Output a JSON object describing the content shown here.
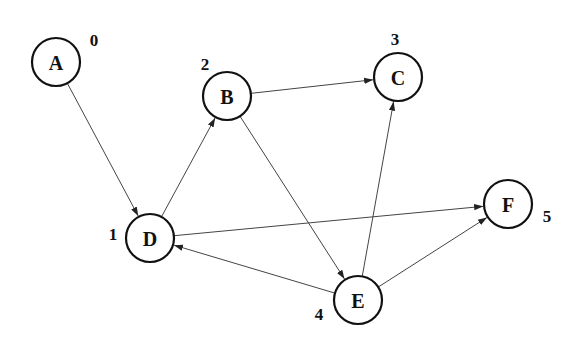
{
  "diagram": {
    "type": "directed-graph",
    "node_radius": 24,
    "colors": {
      "stroke": "#111111",
      "edge": "#444444",
      "background": "#ffffff"
    },
    "nodes": [
      {
        "id": "A",
        "label": "A",
        "order": "0",
        "x": 56,
        "y": 62,
        "order_dx": 38,
        "order_dy": -22
      },
      {
        "id": "B",
        "label": "B",
        "order": "2",
        "x": 227,
        "y": 96,
        "order_dx": -22,
        "order_dy": -32
      },
      {
        "id": "C",
        "label": "C",
        "order": "3",
        "x": 398,
        "y": 77,
        "order_dx": -3,
        "order_dy": -38
      },
      {
        "id": "D",
        "label": "D",
        "order": "1",
        "x": 150,
        "y": 238,
        "order_dx": -37,
        "order_dy": -4
      },
      {
        "id": "E",
        "label": "E",
        "order": "4",
        "x": 358,
        "y": 300,
        "order_dx": -39,
        "order_dy": 14
      },
      {
        "id": "F",
        "label": "F",
        "order": "5",
        "x": 508,
        "y": 204,
        "order_dx": 39,
        "order_dy": 12
      }
    ],
    "edges": [
      {
        "from": "A",
        "to": "D"
      },
      {
        "from": "D",
        "to": "B"
      },
      {
        "from": "B",
        "to": "C"
      },
      {
        "from": "B",
        "to": "E"
      },
      {
        "from": "E",
        "to": "C"
      },
      {
        "from": "E",
        "to": "D"
      },
      {
        "from": "D",
        "to": "F"
      },
      {
        "from": "E",
        "to": "F"
      }
    ]
  }
}
